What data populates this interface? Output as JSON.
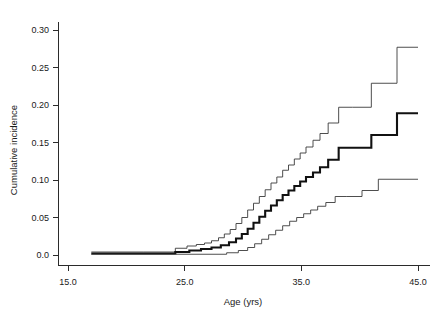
{
  "chart_data": {
    "type": "line",
    "title": "",
    "xlabel": "Age (yrs)",
    "ylabel": "Cumulative incidence",
    "xlim": [
      15.0,
      45.0
    ],
    "ylim": [
      0.0,
      0.315
    ],
    "grid": false,
    "legend": "none",
    "xticks": [
      15.0,
      25.0,
      35.0,
      45.0
    ],
    "xtick_labels": [
      "15.0",
      "25.0",
      "35.0",
      "45.0"
    ],
    "yticks": [
      0.0,
      0.05,
      0.1,
      0.15,
      0.2,
      0.25,
      0.3
    ],
    "ytick_labels": [
      "0.0",
      "0.05",
      "0.10",
      "0.15",
      "0.20",
      "0.25",
      "0.30"
    ],
    "step_style": "post",
    "series": [
      {
        "name": "Upper 95% confidence limit",
        "role": "upper-ci",
        "style": "thin",
        "x": [
          17.0,
          21.5,
          24.2,
          25.2,
          26.0,
          26.7,
          27.3,
          27.9,
          28.4,
          28.9,
          29.4,
          29.9,
          30.4,
          30.9,
          31.4,
          31.9,
          32.4,
          32.9,
          33.4,
          33.9,
          34.4,
          34.9,
          35.4,
          36.0,
          36.6,
          37.3,
          38.2,
          39.4,
          41.0,
          43.2,
          45.0
        ],
        "y": [
          0.004,
          0.004,
          0.009,
          0.012,
          0.014,
          0.016,
          0.019,
          0.023,
          0.028,
          0.034,
          0.042,
          0.05,
          0.06,
          0.069,
          0.078,
          0.087,
          0.096,
          0.104,
          0.113,
          0.12,
          0.128,
          0.136,
          0.144,
          0.153,
          0.162,
          0.176,
          0.197,
          0.197,
          0.229,
          0.277,
          0.277
        ]
      },
      {
        "name": "Cumulative incidence estimate",
        "role": "point-estimate",
        "style": "thick",
        "x": [
          17.0,
          21.5,
          24.2,
          25.4,
          26.4,
          27.3,
          28.1,
          28.8,
          29.4,
          29.9,
          30.4,
          30.9,
          31.4,
          31.9,
          32.4,
          32.9,
          33.4,
          33.9,
          34.4,
          34.9,
          35.4,
          36.0,
          36.6,
          37.3,
          38.2,
          39.4,
          41.0,
          43.2,
          45.0
        ],
        "y": [
          0.002,
          0.002,
          0.004,
          0.006,
          0.008,
          0.01,
          0.013,
          0.017,
          0.022,
          0.028,
          0.035,
          0.043,
          0.051,
          0.059,
          0.066,
          0.073,
          0.08,
          0.086,
          0.092,
          0.098,
          0.104,
          0.11,
          0.117,
          0.127,
          0.143,
          0.143,
          0.16,
          0.189,
          0.189
        ]
      },
      {
        "name": "Lower 95% confidence limit",
        "role": "lower-ci",
        "style": "thin",
        "x": [
          17.0,
          24.2,
          27.0,
          28.6,
          29.6,
          30.4,
          31.0,
          31.6,
          32.2,
          32.8,
          33.4,
          34.0,
          34.6,
          35.2,
          35.8,
          36.4,
          37.1,
          37.9,
          38.9,
          40.2,
          41.6,
          43.2,
          45.0
        ],
        "y": [
          0.001,
          0.001,
          0.001,
          0.003,
          0.006,
          0.01,
          0.015,
          0.021,
          0.027,
          0.033,
          0.039,
          0.045,
          0.05,
          0.055,
          0.06,
          0.065,
          0.07,
          0.078,
          0.078,
          0.086,
          0.101,
          0.101,
          0.101
        ]
      }
    ]
  },
  "axes": {
    "x_title": "Age (yrs)",
    "y_title": "Cumulative incidence"
  }
}
